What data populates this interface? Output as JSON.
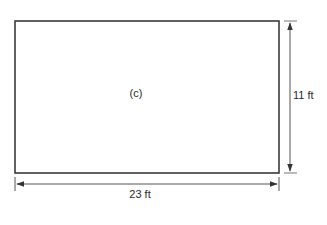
{
  "diagram": {
    "shape": "rectangle",
    "label": "(c)",
    "width_label": "23 ft",
    "height_label": "11 ft",
    "dimensions": {
      "width_ft": 23,
      "height_ft": 11
    },
    "colors": {
      "stroke": "#3a3a3a",
      "dimension_line": "#555555",
      "text": "#2a2a2a",
      "background": "#ffffff"
    }
  }
}
